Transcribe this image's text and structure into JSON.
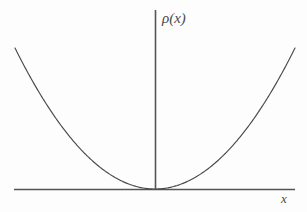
{
  "figure": {
    "background_color": "#fdfdfd",
    "width": 307,
    "height": 212,
    "axis_color": "#555555",
    "curve_color": "#4a4a4a"
  },
  "labels": {
    "y_axis": "ρ(x)",
    "x_axis": "x"
  },
  "chart_data": {
    "type": "line",
    "title": "",
    "subtitle": "",
    "xlabel": "x",
    "ylabel": "ρ(x)",
    "grid": false,
    "legend": null,
    "annotations": [],
    "axes": {
      "origin_px": [
        155,
        189
      ],
      "x_axis_extent_px": [
        14,
        295
      ],
      "y_axis_extent_px": [
        10,
        190
      ],
      "x_ticks": [],
      "y_ticks": [],
      "xlim": [
        -1.0,
        1.0
      ],
      "ylim": [
        0.0,
        1.0
      ],
      "x_axis_label_position": "right-end",
      "y_axis_label_position": "top-end"
    },
    "series": [
      {
        "name": "ρ(x)",
        "shape": "parabola",
        "description": "Symmetric upward parabola with vertex tangent to the x-axis at the origin",
        "equation": "ρ(x) = a x^2",
        "vertex": [
          0.0,
          0.0
        ],
        "x": [
          -1.0,
          -0.9,
          -0.8,
          -0.7,
          -0.6,
          -0.5,
          -0.4,
          -0.3,
          -0.2,
          -0.1,
          0.0,
          0.1,
          0.2,
          0.3,
          0.4,
          0.5,
          0.6,
          0.7,
          0.8,
          0.9,
          1.0
        ],
        "y": [
          1.0,
          0.81,
          0.64,
          0.49,
          0.36,
          0.25,
          0.16,
          0.09,
          0.04,
          0.01,
          0.0,
          0.01,
          0.04,
          0.09,
          0.16,
          0.25,
          0.36,
          0.49,
          0.64,
          0.81,
          1.0
        ]
      }
    ]
  }
}
